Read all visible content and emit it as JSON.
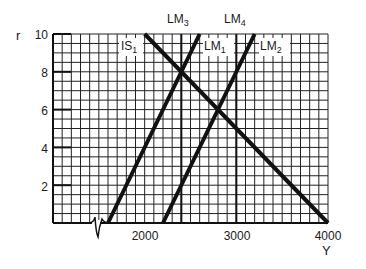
{
  "chart_data": {
    "type": "line",
    "title": "",
    "xlabel": "Y",
    "ylabel": "r",
    "xlim": [
      1000,
      4000
    ],
    "ylim": [
      0,
      10
    ],
    "x_ticks": [
      2000,
      3000,
      4000
    ],
    "y_ticks": [
      2,
      4,
      6,
      8,
      10
    ],
    "grid": true,
    "axis_break_x": true,
    "series": [
      {
        "name": "IS1",
        "label_main": "IS",
        "label_sub": "1",
        "points": [
          [
            2000,
            10
          ],
          [
            4000,
            0
          ]
        ]
      },
      {
        "name": "LM3",
        "label_main": "LM",
        "label_sub": "3",
        "points": [
          [
            1600,
            0
          ],
          [
            2600,
            10
          ]
        ]
      },
      {
        "name": "LM4",
        "label_main": "LM",
        "label_sub": "4",
        "points": [
          [
            2200,
            0
          ],
          [
            3200,
            10
          ]
        ]
      },
      {
        "name": "LM1",
        "label_main": "LM",
        "label_sub": "1",
        "points": [
          [
            2400,
            0
          ],
          [
            2400,
            10
          ]
        ]
      },
      {
        "name": "LM2",
        "label_main": "LM",
        "label_sub": "2",
        "points": [
          [
            3000,
            0
          ],
          [
            3000,
            10
          ]
        ]
      }
    ]
  },
  "labels": {
    "y_axis": "r",
    "x_axis": "Y",
    "x_ticks": [
      "2000",
      "3000",
      "4000"
    ],
    "y_ticks": [
      "2",
      "4",
      "6",
      "8",
      "10"
    ],
    "is1": {
      "main": "IS",
      "sub": "1"
    },
    "lm1": {
      "main": "LM",
      "sub": "1"
    },
    "lm2": {
      "main": "LM",
      "sub": "2"
    },
    "lm3": {
      "main": "LM",
      "sub": "3"
    },
    "lm4": {
      "main": "LM",
      "sub": "4"
    }
  }
}
